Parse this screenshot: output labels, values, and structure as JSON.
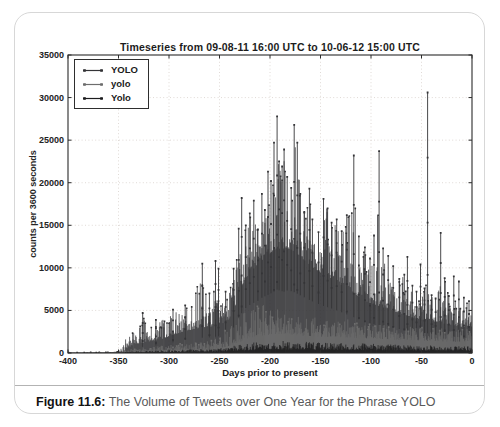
{
  "figure": {
    "caption_label": "Figure 11.6:",
    "caption_text": " The Volume of Tweets over One Year for the Phrase YOLO"
  },
  "chart_data": {
    "type": "line",
    "title": "Timeseries from 09-08-11 16:00 UTC to 10-06-12 15:00 UTC",
    "xlabel": "Days prior to present",
    "ylabel": "counts per 3600 seconds",
    "xlim": [
      -400,
      0
    ],
    "ylim": [
      0,
      35000
    ],
    "xticks": [
      -400,
      -350,
      -300,
      -250,
      -200,
      -150,
      -100,
      -50,
      0
    ],
    "yticks": [
      0,
      5000,
      10000,
      15000,
      20000,
      25000,
      30000,
      35000
    ],
    "grid": true,
    "legend_position": "upper-left",
    "series": [
      {
        "name": "YOLO",
        "color": "#343437",
        "noise_pow": 2.1,
        "envelope_note": "[days, typical_level, spike_level] counts per 3600 s",
        "envelope": [
          [
            -400,
            25,
            60
          ],
          [
            -370,
            30,
            80
          ],
          [
            -352,
            35,
            110
          ],
          [
            -346,
            80,
            700
          ],
          [
            -341,
            600,
            2300
          ],
          [
            -336,
            900,
            2900
          ],
          [
            -331,
            1100,
            3300
          ],
          [
            -326,
            1200,
            4300
          ],
          [
            -321,
            1300,
            3400
          ],
          [
            -316,
            1400,
            3200
          ],
          [
            -311,
            1500,
            3600
          ],
          [
            -306,
            1700,
            4100
          ],
          [
            -301,
            1900,
            4300
          ],
          [
            -296,
            2100,
            4600
          ],
          [
            -291,
            2300,
            4900
          ],
          [
            -286,
            2500,
            5200
          ],
          [
            -281,
            2600,
            5800
          ],
          [
            -276,
            2800,
            7000
          ],
          [
            -271,
            2900,
            8200
          ],
          [
            -267,
            3000,
            9000
          ],
          [
            -263,
            3000,
            7000
          ],
          [
            -258,
            3100,
            6400
          ],
          [
            -254,
            3200,
            8800
          ],
          [
            -250,
            3300,
            6600
          ],
          [
            -245,
            3600,
            6900
          ],
          [
            -240,
            4000,
            7400
          ],
          [
            -236,
            5000,
            9800
          ],
          [
            -232,
            6200,
            13600
          ],
          [
            -228,
            7800,
            16200
          ],
          [
            -224,
            8800,
            14800
          ],
          [
            -220,
            9400,
            16300
          ],
          [
            -216,
            9800,
            16900
          ],
          [
            -212,
            10200,
            14400
          ],
          [
            -208,
            10800,
            17700
          ],
          [
            -204,
            11200,
            16900
          ],
          [
            -200,
            11600,
            20200
          ],
          [
            -196,
            12000,
            23700
          ],
          [
            -193,
            12400,
            26800
          ],
          [
            -190,
            12200,
            22400
          ],
          [
            -186,
            12000,
            22900
          ],
          [
            -182,
            12300,
            20600
          ],
          [
            -179,
            12100,
            19400
          ],
          [
            -176,
            11900,
            24800
          ],
          [
            -173,
            11600,
            23700
          ],
          [
            -169,
            11200,
            18600
          ],
          [
            -165,
            10800,
            16400
          ],
          [
            -161,
            10400,
            18300
          ],
          [
            -157,
            10000,
            15600
          ],
          [
            -152,
            9600,
            14100
          ],
          [
            -147,
            9200,
            17100
          ],
          [
            -142,
            8900,
            16900
          ],
          [
            -137,
            8600,
            15200
          ],
          [
            -132,
            8200,
            15600
          ],
          [
            -127,
            7800,
            14200
          ],
          [
            -122,
            7400,
            16100
          ],
          [
            -117,
            7000,
            19200
          ],
          [
            -112,
            6600,
            13600
          ],
          [
            -107,
            6200,
            12300
          ],
          [
            -102,
            5900,
            11000
          ],
          [
            -97,
            5700,
            13700
          ],
          [
            -92,
            5500,
            19700
          ],
          [
            -87,
            5300,
            12200
          ],
          [
            -82,
            5100,
            11300
          ],
          [
            -77,
            4900,
            10100
          ],
          [
            -72,
            4700,
            8600
          ],
          [
            -67,
            4500,
            9100
          ],
          [
            -62,
            4300,
            7800
          ],
          [
            -57,
            4100,
            7100
          ],
          [
            -52,
            4000,
            6700
          ],
          [
            -48,
            3900,
            7500
          ],
          [
            -44,
            3850,
            8200
          ],
          [
            -40,
            3750,
            6700
          ],
          [
            -36,
            3650,
            6300
          ],
          [
            -31,
            3550,
            8300
          ],
          [
            -27,
            3450,
            8700
          ],
          [
            -23,
            3350,
            6600
          ],
          [
            -19,
            3250,
            6000
          ],
          [
            -15,
            3150,
            6400
          ],
          [
            -10,
            3050,
            6800
          ],
          [
            -5,
            3000,
            6200
          ],
          [
            0,
            3000,
            6000
          ]
        ]
      },
      {
        "name": "yolo",
        "color": "#6d6d6d",
        "noise_pow": 1.8,
        "envelope": [
          [
            -400,
            8,
            20
          ],
          [
            -352,
            15,
            45
          ],
          [
            -346,
            50,
            260
          ],
          [
            -338,
            120,
            480
          ],
          [
            -326,
            180,
            620
          ],
          [
            -312,
            230,
            800
          ],
          [
            -298,
            280,
            980
          ],
          [
            -284,
            330,
            1150
          ],
          [
            -270,
            380,
            1400
          ],
          [
            -258,
            450,
            1800
          ],
          [
            -249,
            550,
            2300
          ],
          [
            -241,
            750,
            3000
          ],
          [
            -234,
            1050,
            3900
          ],
          [
            -227,
            1400,
            4800
          ],
          [
            -220,
            1700,
            5300
          ],
          [
            -212,
            1950,
            5600
          ],
          [
            -204,
            2100,
            5800
          ],
          [
            -196,
            2200,
            5300
          ],
          [
            -188,
            2200,
            4900
          ],
          [
            -180,
            2150,
            4600
          ],
          [
            -172,
            2050,
            4300
          ],
          [
            -164,
            2000,
            4100
          ],
          [
            -156,
            1950,
            4300
          ],
          [
            -148,
            1900,
            4100
          ],
          [
            -140,
            1900,
            3900
          ],
          [
            -132,
            1850,
            3800
          ],
          [
            -124,
            1800,
            4100
          ],
          [
            -116,
            1750,
            3700
          ],
          [
            -108,
            1700,
            3500
          ],
          [
            -100,
            1700,
            3400
          ],
          [
            -92,
            1650,
            3600
          ],
          [
            -84,
            1600,
            3300
          ],
          [
            -76,
            1550,
            3100
          ],
          [
            -68,
            1500,
            3200
          ],
          [
            -60,
            1500,
            3300
          ],
          [
            -52,
            1450,
            3000
          ],
          [
            -44,
            1400,
            2950
          ],
          [
            -36,
            1400,
            3050
          ],
          [
            -28,
            1350,
            2850
          ],
          [
            -20,
            1300,
            2800
          ],
          [
            -12,
            1300,
            2750
          ],
          [
            -4,
            1300,
            2900
          ],
          [
            0,
            1300,
            2900
          ]
        ]
      },
      {
        "name": "Yolo",
        "color": "#1c1c1e",
        "noise_pow": 1.8,
        "envelope": [
          [
            -400,
            4,
            12
          ],
          [
            -352,
            8,
            30
          ],
          [
            -346,
            25,
            120
          ],
          [
            -334,
            50,
            220
          ],
          [
            -318,
            70,
            280
          ],
          [
            -302,
            90,
            330
          ],
          [
            -286,
            110,
            390
          ],
          [
            -270,
            130,
            450
          ],
          [
            -254,
            160,
            560
          ],
          [
            -240,
            210,
            780
          ],
          [
            -226,
            290,
            1050
          ],
          [
            -212,
            340,
            1300
          ],
          [
            -198,
            390,
            1450
          ],
          [
            -184,
            400,
            1480
          ],
          [
            -170,
            390,
            1380
          ],
          [
            -156,
            370,
            1300
          ],
          [
            -142,
            360,
            1250
          ],
          [
            -128,
            350,
            1200
          ],
          [
            -114,
            340,
            1150
          ],
          [
            -100,
            330,
            1100
          ],
          [
            -86,
            320,
            1020
          ],
          [
            -72,
            305,
            960
          ],
          [
            -58,
            290,
            900
          ],
          [
            -44,
            280,
            860
          ],
          [
            -30,
            270,
            820
          ],
          [
            -16,
            265,
            790
          ],
          [
            0,
            260,
            800
          ]
        ]
      }
    ],
    "peak_events_note": "distinct tall spikes of the YOLO series: [days, counts]",
    "peak_events": [
      [
        -326,
        4700
      ],
      [
        -313,
        3900
      ],
      [
        -296,
        5100
      ],
      [
        -284,
        5600
      ],
      [
        -267,
        10500
      ],
      [
        -260,
        7000
      ],
      [
        -254,
        10800
      ],
      [
        -251,
        9900
      ],
      [
        -244,
        7200
      ],
      [
        -236,
        9900
      ],
      [
        -231,
        14600
      ],
      [
        -228,
        18200
      ],
      [
        -224,
        15000
      ],
      [
        -220,
        16400
      ],
      [
        -216,
        17900
      ],
      [
        -212,
        14500
      ],
      [
        -208,
        18700
      ],
      [
        -205,
        16800
      ],
      [
        -202,
        21300
      ],
      [
        -199,
        20200
      ],
      [
        -196,
        24700
      ],
      [
        -193,
        27800
      ],
      [
        -191,
        22500
      ],
      [
        -188,
        21900
      ],
      [
        -186,
        23900
      ],
      [
        -183,
        20700
      ],
      [
        -179,
        19400
      ],
      [
        -176,
        26800
      ],
      [
        -173,
        24700
      ],
      [
        -170,
        18700
      ],
      [
        -166,
        16500
      ],
      [
        -161,
        19300
      ],
      [
        -158,
        15700
      ],
      [
        -152,
        14200
      ],
      [
        -147,
        18100
      ],
      [
        -143,
        17000
      ],
      [
        -139,
        15300
      ],
      [
        -134,
        15700
      ],
      [
        -129,
        14300
      ],
      [
        -124,
        16200
      ],
      [
        -117,
        23200
      ],
      [
        -112,
        13700
      ],
      [
        -106,
        12400
      ],
      [
        -101,
        11100
      ],
      [
        -97,
        13800
      ],
      [
        -92,
        23700
      ],
      [
        -88,
        12300
      ],
      [
        -83,
        11400
      ],
      [
        -78,
        10200
      ],
      [
        -72,
        8700
      ],
      [
        -67,
        9200
      ],
      [
        -64,
        11300
      ],
      [
        -59,
        7900
      ],
      [
        -55,
        7200
      ],
      [
        -51,
        10400
      ],
      [
        -47,
        7600
      ],
      [
        -44,
        30600
      ],
      [
        -40,
        6800
      ],
      [
        -36,
        6400
      ],
      [
        -31,
        14100
      ],
      [
        -27,
        8800
      ],
      [
        -23,
        6700
      ],
      [
        -18,
        9000
      ],
      [
        -13,
        8400
      ],
      [
        -8,
        6500
      ],
      [
        -3,
        6100
      ]
    ],
    "render": {
      "layout": {
        "x": 53,
        "y": 42,
        "w": 404,
        "h": 298
      },
      "svg_size": {
        "w": 471,
        "h": 370
      },
      "sample_step_days": 0.5,
      "noise_seed": 1337,
      "grid_color": "#d8d1cb",
      "frame_color": "#2b2b2b",
      "tick_text_color": "#232323"
    }
  }
}
